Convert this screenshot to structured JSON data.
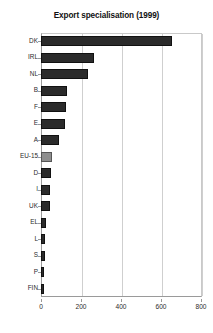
{
  "chart_data": {
    "type": "bar",
    "orientation": "horizontal",
    "title": "Export specialisation (1999)",
    "xlabel": "",
    "ylabel": "",
    "xlim": [
      0,
      800
    ],
    "ylim": null,
    "grid": true,
    "legend": null,
    "xticks": [
      0,
      200,
      400,
      600,
      800
    ],
    "xtick_labels": [
      "0",
      "200",
      "400",
      "600",
      "800"
    ],
    "categories": [
      "DK",
      "IRL",
      "NL",
      "B",
      "F",
      "E",
      "A",
      "EU-15",
      "D",
      "I",
      "UK",
      "EL",
      "L",
      "S",
      "P",
      "FIN"
    ],
    "values": [
      656,
      263,
      233,
      129,
      124,
      119,
      89,
      57,
      50,
      45,
      45,
      25,
      20,
      20,
      15,
      15
    ],
    "highlight_category": "EU-15",
    "colors": {
      "bar": "#2b2b2b",
      "bar_highlight": "#8e8e8e",
      "bar_edge": "#111111",
      "grid": "#cfcfcf",
      "axis": "#9a9a9a",
      "background": "#ffffff",
      "text": "#1a1a1a"
    }
  }
}
